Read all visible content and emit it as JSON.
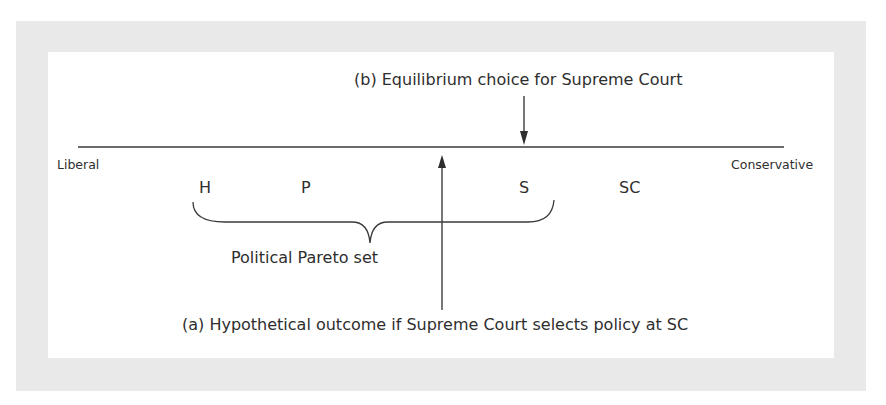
{
  "diagram": {
    "axis": {
      "left_label": "Liberal",
      "right_label": "Conservative"
    },
    "points": [
      {
        "id": "H",
        "label": "H"
      },
      {
        "id": "P",
        "label": "P"
      },
      {
        "id": "S",
        "label": "S"
      },
      {
        "id": "SC",
        "label": "SC"
      }
    ],
    "brace_label": "Political Pareto set",
    "annotations": {
      "b": "(b) Equilibrium choice for Supreme Court",
      "a": "(a) Hypothetical outcome if Supreme Court selects policy at SC"
    },
    "colors": {
      "panel_border": "#e9e9e9",
      "panel": "#ffffff",
      "ink": "#2e2e2e"
    }
  }
}
